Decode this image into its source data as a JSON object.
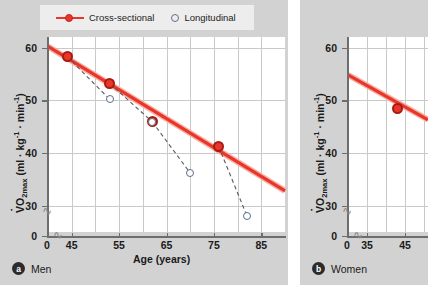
{
  "figure": {
    "panels": [
      {
        "id": "a",
        "badge": "a",
        "caption": "Men",
        "legend": {
          "cross_sectional": "Cross-sectional",
          "longitudinal": "Longitudinal"
        }
      },
      {
        "id": "b",
        "badge": "b",
        "caption": "Women"
      }
    ]
  },
  "colors": {
    "cross_sectional_line": "#e8372a",
    "cross_sectional_marker_edge": "#a81b12",
    "longitudinal_marker_edge": "#5d6e87",
    "panel_background": "#d2d2d2",
    "plot_background": "#ffffff",
    "gridline": "#c9c9c9",
    "axis": "#6d6d6d",
    "legend_background": "#ededed",
    "text": "#1a1a1a"
  },
  "chart_data": [
    {
      "type": "scatter",
      "panel": "a",
      "title": "Men",
      "xlabel": "Age (years)",
      "ylabel": "VO2max (ml · kg⁻¹ · min⁻¹)",
      "ylabel_parts": {
        "v": "V",
        "o": "O",
        "sub": "2max",
        "units": " (ml · kg",
        "sup1": "-1",
        "mid": " · min",
        "sup2": "-1",
        "close": ")"
      },
      "xlim": [
        40,
        90
      ],
      "ylim": [
        25,
        62
      ],
      "xticks": [
        0,
        45,
        55,
        65,
        75,
        85
      ],
      "yticks": [
        0,
        30,
        40,
        50,
        60
      ],
      "xgridlines": [
        45,
        50,
        55,
        60,
        65,
        70,
        75,
        80,
        85
      ],
      "ygridlines": [
        30,
        40,
        50,
        60
      ],
      "grid": true,
      "axis_break_x": true,
      "axis_break_y": true,
      "legend_position": "top",
      "series": [
        {
          "name": "Cross-sectional",
          "style": "line+markers",
          "color": "#e8372a",
          "x": [
            44,
            53,
            62,
            76
          ],
          "y": [
            58.3,
            53.2,
            45.9,
            41.2
          ],
          "fit_line": {
            "x": [
              40,
              90
            ],
            "y": [
              60.2,
              32.8
            ]
          }
        },
        {
          "name": "Longitudinal",
          "style": "markers+dashed-connectors",
          "color": "#5d6e87",
          "x": [
            53,
            62,
            70,
            82
          ],
          "y": [
            50.2,
            45.9,
            36.2,
            28.0
          ],
          "connectors": [
            {
              "from": [
                44,
                58.3
              ],
              "to": [
                53,
                50.2
              ]
            },
            {
              "from": [
                53,
                53.2
              ],
              "to": [
                62,
                45.9
              ]
            },
            {
              "from": [
                62,
                45.9
              ],
              "to": [
                70,
                36.2
              ]
            },
            {
              "from": [
                76,
                41.2
              ],
              "to": [
                82,
                28.0
              ]
            }
          ]
        }
      ]
    },
    {
      "type": "scatter",
      "panel": "b",
      "title": "Women",
      "xlabel": "Age (years)",
      "ylabel": "VO2max (ml · kg⁻¹ · min⁻¹)",
      "ylabel_parts": {
        "v": "V",
        "o": "O",
        "sub": "2max",
        "units": " (ml · kg",
        "sup1": "-1",
        "mid": " · min",
        "sup2": "-1",
        "close": ")"
      },
      "xlim": [
        30,
        51
      ],
      "ylim": [
        25,
        62
      ],
      "xticks": [
        0,
        35,
        45
      ],
      "yticks": [
        0,
        30,
        40,
        50,
        60
      ],
      "xgridlines": [
        35,
        40,
        45,
        50
      ],
      "ygridlines": [
        30,
        40,
        50,
        60
      ],
      "grid": true,
      "axis_break_x": true,
      "axis_break_y": true,
      "clipped_right": true,
      "series": [
        {
          "name": "Cross-sectional",
          "style": "line+markers",
          "color": "#e8372a",
          "x": [
            43
          ],
          "y": [
            48.5
          ],
          "fit_line": {
            "x": [
              30,
              51
            ],
            "y": [
              54.8,
              46.3
            ]
          }
        }
      ]
    }
  ]
}
